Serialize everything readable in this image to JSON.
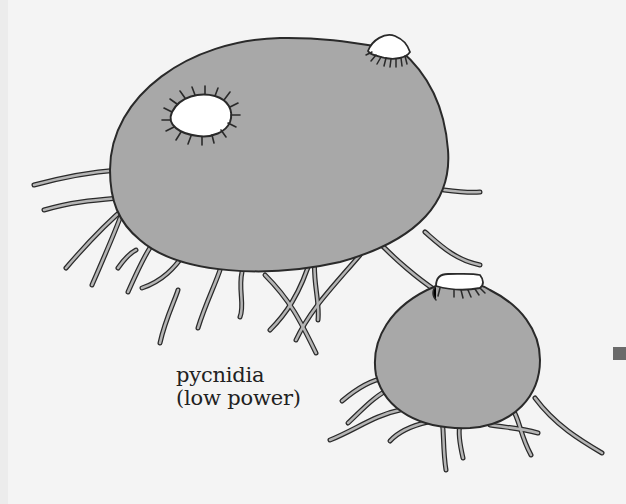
{
  "figure": {
    "caption": {
      "line1": "pycnidia",
      "line2": "(low power)"
    },
    "colors": {
      "background": "#f4f4f4",
      "body_fill": "#a8a8a8",
      "outline": "#2a2a2a",
      "ostiole": "#ffffff",
      "marker": "#6a6a6a"
    },
    "parts": [
      "large-pycnidium",
      "small-pycnidium",
      "ostiole-open",
      "ostiole-raised",
      "hyphae"
    ]
  }
}
